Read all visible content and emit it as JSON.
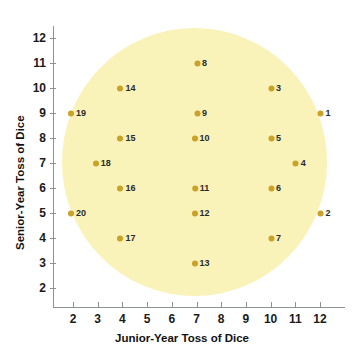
{
  "chart_data": {
    "type": "scatter",
    "title": "",
    "xlabel": "Junior-Year Toss of Dice",
    "ylabel": "Senior-Year Toss of Dice",
    "xlim": [
      1.5,
      12.8
    ],
    "ylim": [
      1.5,
      12.6
    ],
    "xticks": [
      2,
      3,
      4,
      5,
      6,
      7,
      8,
      9,
      10,
      11,
      12
    ],
    "yticks": [
      2,
      3,
      4,
      5,
      6,
      7,
      8,
      9,
      10,
      11,
      12
    ],
    "grid": false,
    "legend": "none",
    "point_color": "#c9a227",
    "cloud_color": "#f9f2b9",
    "annotation_shape": "ellipse",
    "points": [
      {
        "label": "1",
        "x": 12,
        "y": 9
      },
      {
        "label": "2",
        "x": 12,
        "y": 5
      },
      {
        "label": "3",
        "x": 10,
        "y": 10
      },
      {
        "label": "4",
        "x": 11,
        "y": 7
      },
      {
        "label": "5",
        "x": 10,
        "y": 8
      },
      {
        "label": "6",
        "x": 10,
        "y": 6
      },
      {
        "label": "7",
        "x": 10,
        "y": 4
      },
      {
        "label": "8",
        "x": 7,
        "y": 11
      },
      {
        "label": "9",
        "x": 7,
        "y": 9
      },
      {
        "label": "10",
        "x": 7,
        "y": 8
      },
      {
        "label": "11",
        "x": 7,
        "y": 6
      },
      {
        "label": "12",
        "x": 7,
        "y": 5
      },
      {
        "label": "13",
        "x": 7,
        "y": 3
      },
      {
        "label": "14",
        "x": 4,
        "y": 10
      },
      {
        "label": "15",
        "x": 4,
        "y": 8
      },
      {
        "label": "16",
        "x": 4,
        "y": 6
      },
      {
        "label": "17",
        "x": 4,
        "y": 4
      },
      {
        "label": "18",
        "x": 3,
        "y": 7
      },
      {
        "label": "19",
        "x": 2,
        "y": 9
      },
      {
        "label": "20",
        "x": 2,
        "y": 5
      }
    ]
  }
}
